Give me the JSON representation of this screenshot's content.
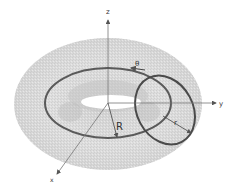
{
  "diagram": {
    "axes": {
      "x_label": "x",
      "y_label": "y",
      "z_label": "z"
    },
    "annotations": {
      "theta": "θ",
      "major_radius": "R",
      "minor_radius": "r"
    },
    "colors": {
      "surface": "#d9d9d9",
      "surface_dark": "#b8b8b8",
      "circle_stroke": "#555555",
      "axis_stroke": "#777777"
    }
  }
}
